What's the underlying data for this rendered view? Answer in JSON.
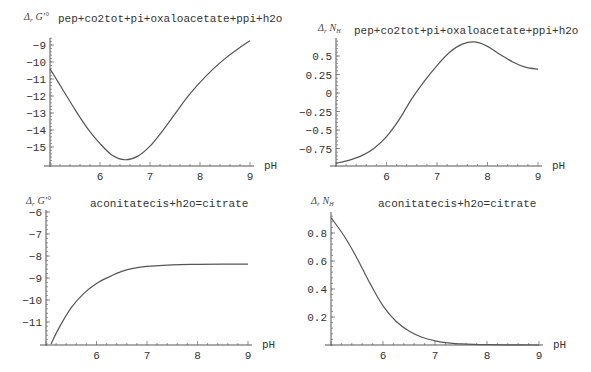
{
  "chart_data": [
    {
      "type": "line",
      "title": "pep+co2tot+pi+oxaloacetate+ppi+h2o",
      "ylabel": "Δr G'°",
      "xlabel": "pH",
      "xlim": [
        5,
        9
      ],
      "ylim": [
        -16.1,
        -8.6
      ],
      "xticks": [
        6,
        7,
        8,
        9
      ],
      "yticks": [
        -15,
        -14,
        -13,
        -12,
        -11,
        -10,
        -9
      ],
      "x": [
        5.0,
        5.25,
        5.5,
        5.75,
        6.0,
        6.25,
        6.5,
        6.75,
        7.0,
        7.25,
        7.5,
        7.75,
        8.0,
        8.25,
        8.5,
        8.75,
        9.0
      ],
      "values": [
        -10.4,
        -11.6,
        -12.8,
        -13.9,
        -14.8,
        -15.5,
        -15.75,
        -15.55,
        -14.95,
        -14.05,
        -13.05,
        -12.05,
        -11.2,
        -10.45,
        -9.8,
        -9.25,
        -8.75
      ],
      "grid": false
    },
    {
      "type": "line",
      "title": "pep+co2tot+pi+oxaloacetate+ppi+h2o",
      "ylabel": "Δr NH",
      "xlabel": "pH",
      "xlim": [
        5,
        9
      ],
      "ylim": [
        -1.0,
        0.75
      ],
      "xticks": [
        6,
        7,
        8,
        9
      ],
      "yticks": [
        -0.75,
        -0.5,
        -0.25,
        0,
        0.25,
        0.5
      ],
      "x": [
        5.0,
        5.25,
        5.5,
        5.75,
        6.0,
        6.25,
        6.5,
        6.75,
        7.0,
        7.25,
        7.5,
        7.75,
        8.0,
        8.25,
        8.5,
        8.75,
        9.0
      ],
      "values": [
        -0.95,
        -0.91,
        -0.85,
        -0.75,
        -0.59,
        -0.36,
        -0.08,
        0.16,
        0.37,
        0.55,
        0.66,
        0.69,
        0.63,
        0.52,
        0.42,
        0.35,
        0.32
      ],
      "grid": false
    },
    {
      "type": "line",
      "title": "aconitatecis+h2o=citrate",
      "ylabel": "Δr G'°",
      "xlabel": "pH",
      "xlim": [
        5,
        9
      ],
      "ylim": [
        -12,
        -6
      ],
      "xticks": [
        6,
        7,
        8,
        9
      ],
      "yticks": [
        -11,
        -10,
        -9,
        -8,
        -7,
        -6
      ],
      "x": [
        5.1,
        5.25,
        5.5,
        5.75,
        6.0,
        6.25,
        6.5,
        6.75,
        7.0,
        7.5,
        8.0,
        8.5,
        9.0
      ],
      "values": [
        -12.0,
        -11.3,
        -10.35,
        -9.7,
        -9.25,
        -8.95,
        -8.7,
        -8.55,
        -8.47,
        -8.4,
        -8.38,
        -8.37,
        -8.37
      ],
      "grid": false
    },
    {
      "type": "line",
      "title": "aconitatecis+h2o=citrate",
      "ylabel": "Δr NH",
      "xlabel": "pH",
      "xlim": [
        5,
        9
      ],
      "ylim": [
        0,
        0.95
      ],
      "xticks": [
        6,
        7,
        8,
        9
      ],
      "yticks": [
        0.2,
        0.4,
        0.6,
        0.8
      ],
      "x": [
        5.0,
        5.25,
        5.5,
        5.75,
        6.0,
        6.25,
        6.5,
        6.75,
        7.0,
        7.25,
        7.5,
        7.75,
        8.0,
        8.5,
        9.0
      ],
      "values": [
        0.91,
        0.78,
        0.62,
        0.44,
        0.28,
        0.17,
        0.1,
        0.055,
        0.03,
        0.015,
        0.008,
        0.004,
        0.002,
        0.001,
        0.0
      ],
      "grid": false
    }
  ],
  "labels": {
    "delta_r": "Δ",
    "r_sub": "r",
    "g_prime": "G'°",
    "n": "N",
    "h_sub": "H",
    "ph": "pH"
  }
}
